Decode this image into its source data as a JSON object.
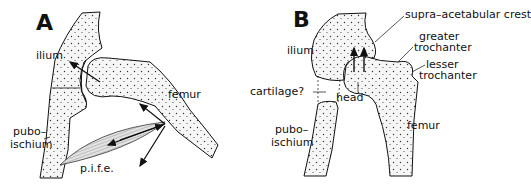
{
  "figure": {
    "panels": [
      {
        "id": "A",
        "letter": "A",
        "labels": {
          "ilium": "ilium",
          "femur": "femur",
          "puboischium_1": "pubo–",
          "puboischium_2": "ischium",
          "pife": "p.i.f.e."
        }
      },
      {
        "id": "B",
        "letter": "B",
        "labels": {
          "supra": "supra–acetabular crest",
          "greater_1": "greater",
          "greater_2": "trochanter",
          "lesser_1": "lesser",
          "lesser_2": "trochanter",
          "ilium": "ilium",
          "cartilage": "cartilage?",
          "head": "head",
          "puboischium_1": "pubo–",
          "puboischium_2": "ischium",
          "femur": "femur"
        }
      }
    ],
    "colors": {
      "ink": "#111111",
      "bone_fill": "#f4f4f4",
      "muscle_fill": "#dcdcdc"
    }
  }
}
